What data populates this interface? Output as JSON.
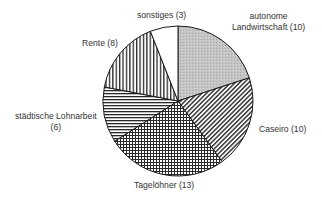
{
  "chart_data": {
    "type": "pie",
    "title": "",
    "total": 50,
    "start_angle_deg": 0,
    "direction": "clockwise",
    "slices": [
      {
        "label": "autonome Landwirtschaft",
        "value": 10,
        "pattern": "gray-fill",
        "color": "#bdbdbd"
      },
      {
        "label": "Caseiro",
        "value": 10,
        "pattern": "diagonal-hatch",
        "color": "#333333"
      },
      {
        "label": "Tagelöhner",
        "value": 13,
        "pattern": "crosshatch",
        "color": "#333333"
      },
      {
        "label": "städtische Lohnarbeit",
        "value": 6,
        "pattern": "horizontal-lines",
        "color": "#333333"
      },
      {
        "label": "Rente",
        "value": 8,
        "pattern": "vertical-lines",
        "color": "#333333"
      },
      {
        "label": "sonstiges",
        "value": 3,
        "pattern": "white",
        "color": "#ffffff"
      }
    ]
  },
  "labels": {
    "autonome_line1": "autonome",
    "autonome_line2": "Landwirtschaft (10)",
    "caseiro": "Caseiro (10)",
    "tageloehner": "Tagelöhner (13)",
    "staedtische_line1": "städtische Lohnarbeit",
    "staedtische_line2": "(6)",
    "rente": "Rente (8)",
    "sonstiges": "sonstiges (3)"
  }
}
